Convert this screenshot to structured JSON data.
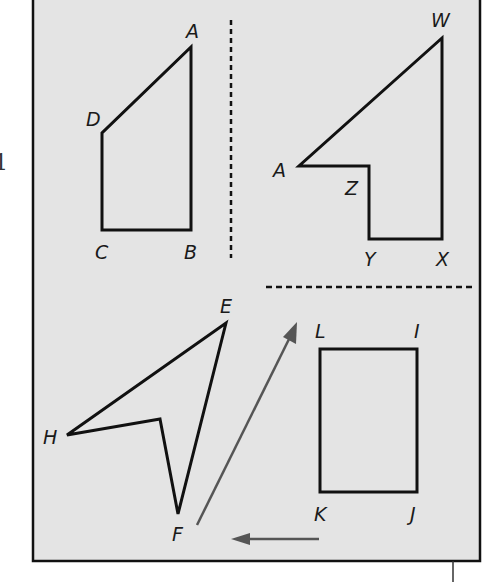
{
  "colors": {
    "page_background": "#ffffff",
    "panel_background": "#e4e4e4",
    "figure_stroke": "#111111",
    "arrow_stroke": "#555555",
    "frame_stroke": "#111111"
  },
  "margin_text": "1",
  "figures": {
    "top_left": {
      "labels": {
        "A": "A",
        "B": "B",
        "C": "C",
        "D": "D"
      }
    },
    "top_right": {
      "labels": {
        "W": "W",
        "X": "X",
        "Y": "Y",
        "Z": "Z",
        "A": "A"
      }
    },
    "bottom_left": {
      "labels": {
        "E": "E",
        "F": "F",
        "H": "H"
      }
    },
    "bottom_right": {
      "labels": {
        "L": "L",
        "I": "I",
        "J": "J",
        "K": "K"
      }
    }
  },
  "dividers": {
    "vertical": "dashed",
    "horizontal": "dashed"
  },
  "arrows": [
    {
      "name": "diagonal-translation-arrow",
      "direction": "up-right"
    },
    {
      "name": "horizontal-translation-arrow",
      "direction": "left"
    }
  ]
}
